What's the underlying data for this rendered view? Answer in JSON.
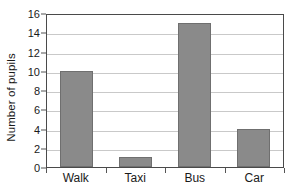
{
  "chart_data": {
    "type": "bar",
    "title": "",
    "xlabel": "",
    "ylabel": "Number of pupils",
    "categories": [
      "Walk",
      "Taxi",
      "Bus",
      "Car"
    ],
    "values": [
      10,
      1,
      15,
      4
    ],
    "ylim": [
      0,
      16
    ],
    "ytick_step": 2,
    "yticks": [
      0,
      2,
      4,
      6,
      8,
      10,
      12,
      14,
      16
    ],
    "ytick_labels": [
      "0",
      "2",
      "4",
      "6",
      "8",
      "10",
      "12",
      "14",
      "16"
    ],
    "grid": true,
    "grid_axis": "y",
    "legend": false,
    "legend_position": "none",
    "bar_color": "#8a8a8a",
    "bar_edge_color": "#6f6f6f",
    "gridline_color": "#c9c9c9",
    "axis_color": "#4a4a4a",
    "background_color": "#ffffff"
  }
}
